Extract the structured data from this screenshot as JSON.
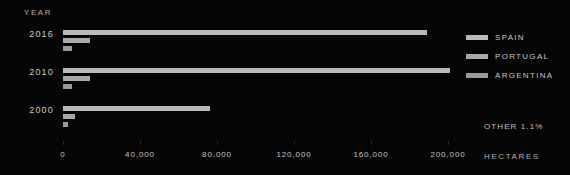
{
  "chart_data": {
    "type": "bar",
    "orientation": "horizontal",
    "title": "",
    "xlabel": "HECTARES",
    "ylabel": "YEAR",
    "categories": [
      "2016",
      "2010",
      "2000"
    ],
    "series": [
      {
        "name": "SPAIN",
        "color": "#b9b9b9",
        "values": [
          189000,
          201000,
          76400
        ]
      },
      {
        "name": "PORTUGAL",
        "color": "#a8a8a8",
        "values": [
          14000,
          14000,
          6200
        ]
      },
      {
        "name": "ARGENTINA",
        "color": "#9a9a9a",
        "values": [
          4700,
          4700,
          2600
        ]
      }
    ],
    "xlim": [
      0,
      210000
    ],
    "xticks": [
      0,
      40000,
      80000,
      120000,
      160000,
      200000
    ],
    "xtick_labels": [
      "0",
      "40,000",
      "80,000",
      "120,000",
      "160,000",
      "200,000"
    ],
    "grid": false,
    "legend_position": "right",
    "annotations": [
      "OTHER 1.1%"
    ]
  },
  "axes": {
    "year_title": "YEAR",
    "hectares_title": "HECTARES"
  },
  "legend": {
    "items": [
      {
        "label": "SPAIN"
      },
      {
        "label": "PORTUGAL"
      },
      {
        "label": "ARGENTINA"
      }
    ]
  },
  "notes": {
    "other": "OTHER 1.1%"
  },
  "colors": {
    "background": "#050505",
    "bar": "#b5b5b5",
    "text": "#c6c6c6"
  }
}
